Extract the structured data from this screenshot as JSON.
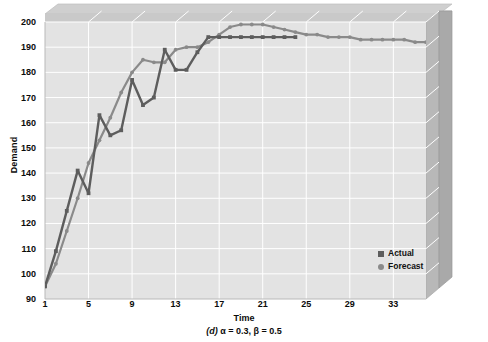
{
  "chart_data": {
    "type": "line",
    "title": "",
    "caption": "(d) α = 0.3, β = 0.5",
    "caption_label": "(d)",
    "caption_params": " α = 0.3, β = 0.5",
    "xlabel": "Time",
    "ylabel": "Demand",
    "xlim": [
      1,
      36
    ],
    "ylim": [
      90,
      200
    ],
    "yticks": [
      90,
      100,
      110,
      120,
      130,
      140,
      150,
      160,
      170,
      180,
      190,
      200
    ],
    "xticks": [
      1,
      5,
      9,
      13,
      17,
      21,
      25,
      29,
      33
    ],
    "grid": true,
    "legend_position": "inside-lower-right",
    "style": "3d-wall",
    "colors": {
      "actual": "#5d5d5d",
      "forecast": "#8a8a8a",
      "plot_background": "#e3e3e3",
      "wall_top": "#c9c9c9",
      "wall_right": "#b5b5b5",
      "grid_line": "#ffffff",
      "text": "#0b0b0b"
    },
    "series": [
      {
        "name": "Actual",
        "marker": "square",
        "color": "#5d5d5d",
        "x": [
          1,
          2,
          3,
          4,
          5,
          6,
          7,
          8,
          9,
          10,
          11,
          12,
          13,
          14,
          15,
          16,
          17,
          18,
          19,
          20,
          21,
          22,
          23,
          24
        ],
        "values": [
          95,
          109,
          125,
          141,
          132,
          163,
          155,
          157,
          177,
          167,
          170,
          189,
          181,
          181,
          188,
          194,
          194,
          194,
          194,
          194,
          194,
          194,
          194,
          194
        ]
      },
      {
        "name": "Forecast",
        "marker": "circle",
        "color": "#8a8a8a",
        "x": [
          1,
          2,
          3,
          4,
          5,
          6,
          7,
          8,
          9,
          10,
          11,
          12,
          13,
          14,
          15,
          16,
          17,
          18,
          19,
          20,
          21,
          22,
          23,
          24,
          25,
          26,
          27,
          28,
          29,
          30,
          31,
          32,
          33,
          34,
          35,
          36
        ],
        "values": [
          95,
          104,
          117,
          130,
          144,
          153,
          162,
          172,
          180,
          185,
          184,
          184,
          189,
          190,
          190,
          192,
          195,
          198,
          199,
          199,
          199,
          198,
          197,
          196,
          195,
          195,
          194,
          194,
          194,
          193,
          193,
          193,
          193,
          193,
          192,
          192
        ]
      }
    ]
  },
  "legend": {
    "items": [
      {
        "label": "Actual",
        "marker": "square"
      },
      {
        "label": "Forecast",
        "marker": "circle"
      }
    ]
  }
}
